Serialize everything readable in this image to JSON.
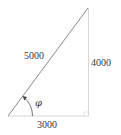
{
  "diagram": {
    "type": "right-triangle",
    "hypotenuse_label": "5000",
    "vertical_leg_label": "4000",
    "horizontal_leg_label": "3000",
    "angle_label": "φ",
    "colors": {
      "hypotenuse": "#8a8a8a",
      "legs": "#d0d0d0",
      "text": "#3a3a3a"
    }
  }
}
